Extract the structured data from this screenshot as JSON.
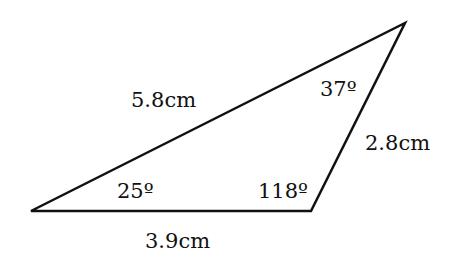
{
  "diagram": {
    "type": "triangle",
    "vertices": {
      "A": {
        "x": 31,
        "y": 211
      },
      "B": {
        "x": 311,
        "y": 211
      },
      "C": {
        "x": 405,
        "y": 23
      }
    },
    "sides": {
      "AC": "5.8cm",
      "BC": "2.8cm",
      "AB": "3.9cm"
    },
    "angles": {
      "A": "25º",
      "B": "118º",
      "C": "37º"
    },
    "stroke_color": "#111111",
    "background": "#ffffff"
  }
}
